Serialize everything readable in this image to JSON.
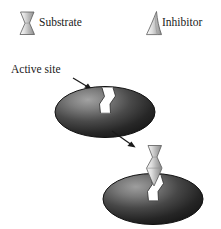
{
  "figure": {
    "background_color": "#ffffff",
    "width": 221,
    "height": 229
  },
  "legend": {
    "items": [
      {
        "key": "substrate",
        "label": "Substrate",
        "icon": "hourglass-shape-icon",
        "shape": "hourglass",
        "fill_light": "#f2f2f2",
        "fill_dark": "#8a8a8a",
        "outline_color": "#5a5a5a"
      },
      {
        "key": "inhibitor",
        "label": "Inhibitor",
        "icon": "wedge-shape-icon",
        "shape": "curved-wedge",
        "fill_light": "#f2f2f2",
        "fill_dark": "#8a8a8a",
        "outline_color": "#5a5a5a"
      }
    ]
  },
  "annotations": {
    "active_site": {
      "label": "Active site",
      "pointer": "arrow-down-right",
      "arrow_color": "#1a1a1a"
    },
    "reaction_arrow": {
      "label": "",
      "direction": "down-right",
      "arrow_color": "#1a1a1a"
    }
  },
  "enzymes": [
    {
      "key": "enzyme-empty",
      "state": "active site empty",
      "cleft_occupied": false,
      "fill_center": "#8f8f8f",
      "fill_edge": "#1c1c1c",
      "outline_color": "#111111"
    },
    {
      "key": "enzyme-substrate-binding",
      "state": "substrate entering active site",
      "cleft_occupied": true,
      "fill_center": "#8f8f8f",
      "fill_edge": "#1c1c1c",
      "outline_color": "#111111"
    }
  ],
  "colors": {
    "text": "#1a1a1a",
    "enzyme_dark": "#1c1c1c",
    "enzyme_light": "#8f8f8f",
    "molecule_light": "#f2f2f2",
    "molecule_mid": "#b8b8b8",
    "molecule_dark": "#7e7e7e",
    "stroke": "#4f4f4f"
  }
}
